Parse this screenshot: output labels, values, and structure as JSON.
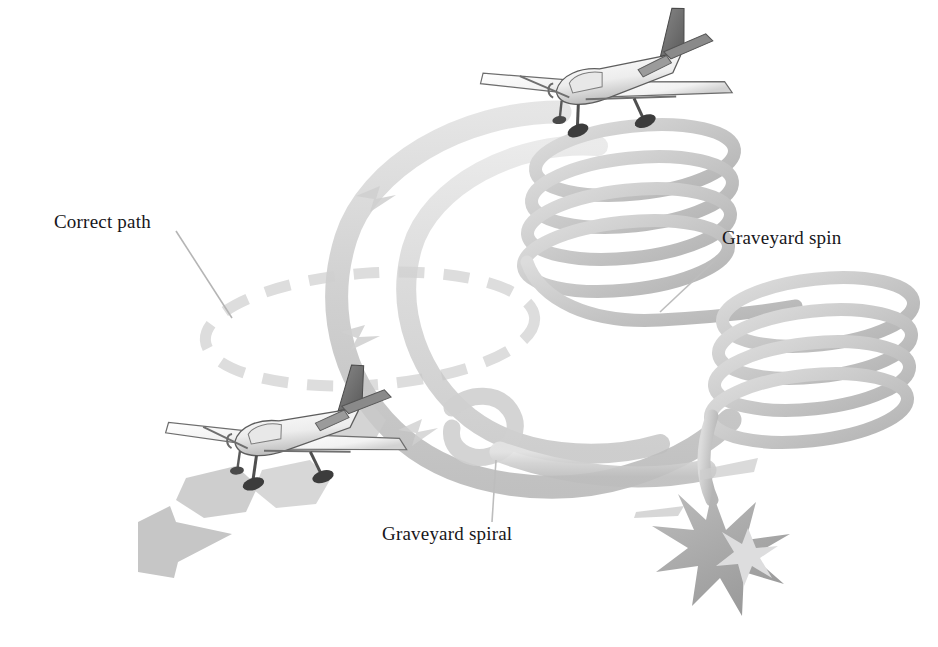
{
  "figure": {
    "kind": "technical-illustration",
    "background_color": "#ffffff",
    "labels": [
      {
        "id": "correct-path",
        "text": "Correct path"
      },
      {
        "id": "graveyard-spin",
        "text": "Graveyard spin"
      },
      {
        "id": "graveyard-spiral",
        "text": "Graveyard spiral"
      }
    ],
    "palette": {
      "ink": "#17161a",
      "band_light": "#dcdcdc",
      "band_mid": "#c9c9c9",
      "band_dark": "#b6b6b6",
      "helix": "#cfcfcf",
      "helix_shade": "#b9b9b9",
      "dashed_path": "#dedede",
      "leader_line": "#b9b9b9",
      "arrow_gray": "#c4c4c4",
      "burst_gray": "#a9a9a9",
      "burst_light": "#d8d8d8",
      "plane_outline": "#5d5d5d",
      "plane_body": "#fbfbfb",
      "plane_shade": "#8e8e8e",
      "plane_dark": "#4a4a4a"
    },
    "elements": [
      {
        "id": "aircraft-upper",
        "name": "high-wing single-engine airplane",
        "position": "top-center-right"
      },
      {
        "id": "aircraft-lower",
        "name": "high-wing single-engine airplane",
        "position": "lower-left"
      },
      {
        "id": "correct-path-ellipse",
        "name": "dashed level-turn circle",
        "style": "dashed"
      },
      {
        "id": "spiral-band",
        "name": "graveyard spiral descending ribbon",
        "turns": 1.5
      },
      {
        "id": "helix-upper",
        "name": "graveyard spin coil upper",
        "turns": 4
      },
      {
        "id": "helix-lower",
        "name": "graveyard spin coil lower",
        "turns": 4
      },
      {
        "id": "impact-burst",
        "name": "crash impact starburst"
      },
      {
        "id": "arrow-lower-left",
        "name": "direction arrow"
      },
      {
        "id": "arrow-under-aircraft",
        "name": "direction arrow"
      }
    ]
  }
}
